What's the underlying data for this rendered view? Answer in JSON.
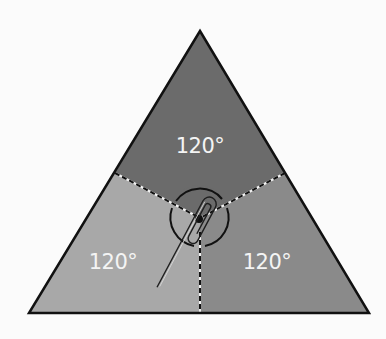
{
  "diagram": {
    "background_color": "#fbfbfb",
    "triangle": {
      "vertices": {
        "top": [
          200,
          31
        ],
        "bottom_left": [
          29,
          313
        ],
        "bottom_right": [
          369,
          313
        ]
      },
      "outline_color": "#111111"
    },
    "center": [
      200,
      218
    ],
    "regions": [
      {
        "id": "top",
        "label": "120°",
        "color": "#6b6b6b",
        "label_pos": [
          200,
          153
        ]
      },
      {
        "id": "left",
        "label": "120°",
        "color": "#a8a8a8",
        "label_pos": [
          113,
          268
        ]
      },
      {
        "id": "right",
        "label": "120°",
        "color": "#8a8a8a",
        "label_pos": [
          267,
          268
        ]
      }
    ],
    "dividers": [
      {
        "from": [
          115,
          173
        ],
        "to": [
          200,
          218
        ]
      },
      {
        "from": [
          285,
          173
        ],
        "to": [
          200,
          218
        ]
      },
      {
        "from": [
          200,
          218
        ],
        "to": [
          200,
          313
        ]
      }
    ],
    "circle": {
      "center": [
        200,
        218
      ],
      "radius": 29,
      "color": "#111111"
    },
    "center_dot": {
      "center": [
        199,
        219
      ],
      "radius": 4,
      "color": "#111111"
    },
    "paperclip": {
      "pivot": [
        199,
        219
      ],
      "tail_end": [
        148,
        288
      ],
      "color": "#222222"
    }
  }
}
